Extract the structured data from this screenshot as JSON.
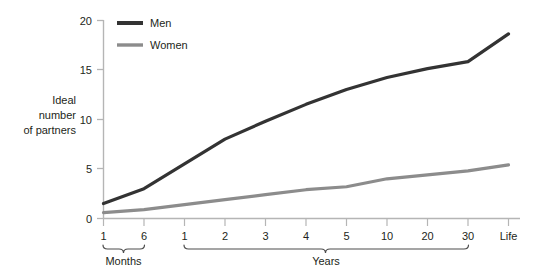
{
  "chart_data": {
    "type": "line",
    "title": "",
    "subtitle": "",
    "xlabel": "",
    "ylabel": "Ideal number of partners",
    "ylabel_lines": [
      "Ideal",
      "number",
      "of partners"
    ],
    "ylim": [
      0,
      20
    ],
    "yticks": [
      0,
      5,
      10,
      15,
      20
    ],
    "ytick_labels": [
      "0",
      "5",
      "10",
      "15",
      "20"
    ],
    "grid": false,
    "legend_position": "top-left-inside",
    "categories": [
      "1",
      "6",
      "1",
      "2",
      "3",
      "4",
      "5",
      "10",
      "20",
      "30",
      "Life"
    ],
    "x_groups": [
      {
        "label": "Months",
        "tick_labels": [
          "1",
          "6"
        ],
        "start_index": 0,
        "end_index": 1
      },
      {
        "label": "Years",
        "tick_labels": [
          "1",
          "2",
          "3",
          "4",
          "5",
          "10",
          "20",
          "30"
        ],
        "start_index": 2,
        "end_index": 9
      },
      {
        "label": "",
        "tick_labels": [
          "Life"
        ],
        "start_index": 10,
        "end_index": 10
      }
    ],
    "series": [
      {
        "name": "Men",
        "color": "#333333",
        "values": [
          1.5,
          3.0,
          5.5,
          8.0,
          9.8,
          11.5,
          13.0,
          14.2,
          15.1,
          15.8,
          18.6
        ]
      },
      {
        "name": "Women",
        "color": "#8c8c8c",
        "values": [
          0.6,
          0.9,
          1.4,
          1.9,
          2.4,
          2.9,
          3.2,
          4.0,
          4.4,
          4.8,
          5.4
        ]
      }
    ],
    "annotations": []
  },
  "legend": {
    "entries": [
      {
        "label": "Men",
        "color": "#333333"
      },
      {
        "label": "Women",
        "color": "#8c8c8c"
      }
    ]
  },
  "axis": {
    "y_title_line1": "Ideal",
    "y_title_line2": "number",
    "y_title_line3": "of partners",
    "ytick_0": "0",
    "ytick_5": "5",
    "ytick_10": "10",
    "ytick_15": "15",
    "ytick_20": "20"
  },
  "xaxis": {
    "tick_0": "1",
    "tick_1": "6",
    "tick_2": "1",
    "tick_3": "2",
    "tick_4": "3",
    "tick_5": "4",
    "tick_6": "5",
    "tick_7": "10",
    "tick_8": "20",
    "tick_9": "30",
    "tick_10": "Life",
    "group_months": "Months",
    "group_years": "Years"
  },
  "colors": {
    "men_line": "#333333",
    "women_line": "#8c8c8c",
    "axis": "#b5b5b5",
    "text": "#231f20",
    "bracket": "#4d4d4d",
    "background": "#ffffff"
  }
}
